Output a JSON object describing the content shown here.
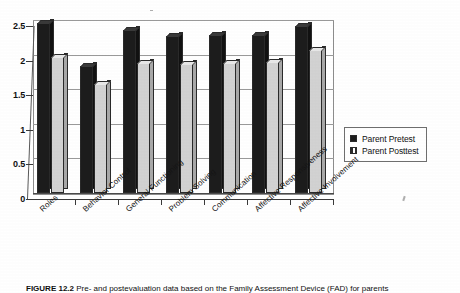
{
  "figure": {
    "caption_label": "FIGURE 12.2",
    "caption_text": "Pre- and postevaluation data based on the Family Assessment Device (FAD) for parents"
  },
  "legend": {
    "position": "right",
    "items": [
      {
        "label": "Parent Pretest",
        "swatch": "dark-square-swatch",
        "color": "#1c1c1c"
      },
      {
        "label": "Parent Posttest",
        "swatch": "light-hatched-square-swatch",
        "color": "#d2d2d2"
      }
    ]
  },
  "axes": {
    "y_ticks": [
      "0",
      "0.5",
      "1",
      "1.5",
      "2",
      "2.5"
    ],
    "x_categories": [
      "Roles",
      "Behavior Control",
      "General Functioning",
      "Problem Solving",
      "Communication",
      "Affective Responsiveness",
      "Affective Involvement"
    ]
  },
  "chart_data": {
    "type": "bar",
    "title": "",
    "subtitle": "",
    "xlabel": "",
    "ylabel": "",
    "ylim": [
      0,
      2.5
    ],
    "yticks": [
      0,
      0.5,
      1,
      1.5,
      2,
      2.5
    ],
    "grid": true,
    "grid_axis": "y",
    "legend_position": "right",
    "style": "3d-grouped-columns-grayscale",
    "categories": [
      "Roles",
      "Behavior Control",
      "General Functioning",
      "Problem Solving",
      "Communication",
      "Affective Responsiveness",
      "Affective Involvement"
    ],
    "series": [
      {
        "name": "Parent Pretest",
        "color": "#1c1c1c",
        "values": [
          2.45,
          1.83,
          2.35,
          2.27,
          2.28,
          2.29,
          2.42
        ]
      },
      {
        "name": "Parent Posttest",
        "color": "#d2d2d2",
        "values": [
          1.96,
          1.57,
          1.88,
          1.86,
          1.88,
          1.9,
          2.07
        ]
      }
    ]
  }
}
